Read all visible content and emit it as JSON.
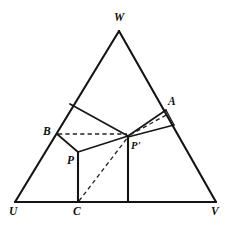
{
  "figure": {
    "kind": "geometry-diagram",
    "caption": "",
    "background_color": "#ffffff",
    "ink_color": "#141414",
    "width": 232,
    "height": 225,
    "labels": {
      "w": "W",
      "a": "A",
      "b": "B",
      "p": "P",
      "p_prime": "P'",
      "u": "U",
      "c": "C",
      "v": "V"
    },
    "points": {
      "W": [
        119,
        31
      ],
      "U": [
        15,
        202
      ],
      "V": [
        216,
        202
      ],
      "A": [
        166,
        110
      ],
      "B": [
        57,
        134
      ],
      "P": [
        78,
        152
      ],
      "Pprime": [
        128,
        136
      ],
      "C": [
        78,
        202
      ],
      "D": [
        128,
        202
      ],
      "E": [
        70,
        104
      ],
      "F": [
        174,
        125
      ]
    },
    "segments": [
      {
        "name": "triangle-edge-UW",
        "from": "U",
        "to": "W",
        "style": "solid-thick"
      },
      {
        "name": "triangle-edge-WV",
        "from": "W",
        "to": "V",
        "style": "solid-thick"
      },
      {
        "name": "triangle-edge-UV",
        "from": "U",
        "to": "V",
        "style": "solid-thick"
      },
      {
        "name": "segment-E-to-Pprime",
        "from": "E",
        "to": "Pprime",
        "style": "solid"
      },
      {
        "name": "segment-B-to-P",
        "from": "B",
        "to": "P",
        "style": "solid"
      },
      {
        "name": "segment-P-to-Pprime",
        "from": "P",
        "to": "Pprime",
        "style": "solid"
      },
      {
        "name": "segment-P-to-C",
        "from": "P",
        "to": "C",
        "style": "solid-thick"
      },
      {
        "name": "segment-Pprime-to-D",
        "from": "Pprime",
        "to": "D",
        "style": "solid-thick"
      },
      {
        "name": "segment-Pprime-to-A",
        "from": "Pprime",
        "to": "A",
        "style": "solid"
      },
      {
        "name": "segment-Pprime-to-F",
        "from": "Pprime",
        "to": "F",
        "style": "solid"
      },
      {
        "name": "segment-A-to-F",
        "from": "A",
        "to": "F",
        "style": "thin"
      },
      {
        "name": "dashed-B-to-Pprime",
        "from": "B",
        "to": "Pprime",
        "style": "dashed"
      },
      {
        "name": "dashed-C-to-Pprime",
        "from": "C",
        "to": "Pprime",
        "style": "dashed"
      },
      {
        "name": "dashed-Pprime-to-A",
        "from": "Pprime",
        "to": "A",
        "style": "dashed"
      }
    ]
  }
}
